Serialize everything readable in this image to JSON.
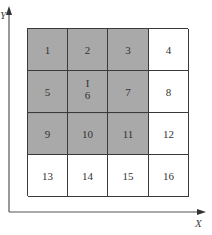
{
  "diagram": {
    "axes": {
      "x_label": "X",
      "y_label": "Y"
    },
    "grid": {
      "rows": 4,
      "cols": 4,
      "cells": [
        {
          "label": "1",
          "shaded": true
        },
        {
          "label": "2",
          "shaded": true
        },
        {
          "label": "3",
          "shaded": true
        },
        {
          "label": "4",
          "shaded": false
        },
        {
          "label": "5",
          "shaded": true
        },
        {
          "label": "6",
          "shaded": true,
          "marker": "I"
        },
        {
          "label": "7",
          "shaded": true
        },
        {
          "label": "8",
          "shaded": false
        },
        {
          "label": "9",
          "shaded": true
        },
        {
          "label": "10",
          "shaded": true
        },
        {
          "label": "11",
          "shaded": true
        },
        {
          "label": "12",
          "shaded": false
        },
        {
          "label": "13",
          "shaded": false
        },
        {
          "label": "14",
          "shaded": false
        },
        {
          "label": "15",
          "shaded": false
        },
        {
          "label": "16",
          "shaded": false
        }
      ]
    },
    "colors": {
      "shaded_fill": "#a9a9a9",
      "clear_fill": "#ffffff",
      "grid_line": "#3a3a3a",
      "axis_line": "#555555"
    }
  }
}
